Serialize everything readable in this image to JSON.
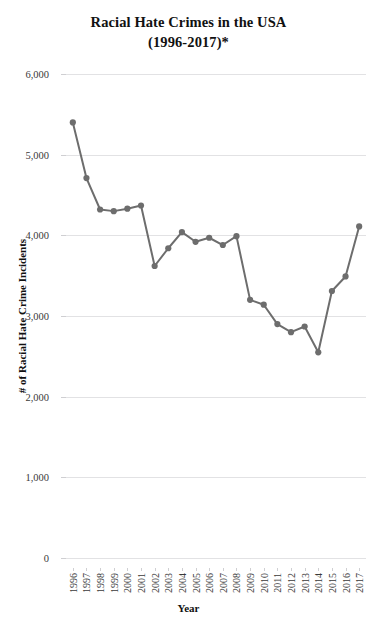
{
  "chart_data": {
    "type": "line",
    "title": "Racial Hate Crimes in the USA (1996-2017)*",
    "title_line1": "Racial Hate Crimes in the USA",
    "title_line2": "(1996-2017)*",
    "xlabel": "Year",
    "ylabel": "# of Racial Hate Crime Incidents",
    "ylim": [
      0,
      6000
    ],
    "ytick_values": [
      0,
      1000,
      2000,
      3000,
      4000,
      5000,
      6000
    ],
    "ytick_labels": [
      "0",
      "1,000",
      "2,000",
      "3,000",
      "4,000",
      "5,000",
      "6,000"
    ],
    "grid": true,
    "legend": false,
    "legend_position": "none",
    "categories": [
      "1996",
      "1997",
      "1998",
      "1999",
      "2000",
      "2001",
      "2002",
      "2003",
      "2004",
      "2005",
      "2006",
      "2007",
      "2008",
      "2009",
      "2010",
      "2011",
      "2012",
      "2013",
      "2014",
      "2015",
      "2016",
      "2017"
    ],
    "values": [
      5400,
      4710,
      4320,
      4300,
      4330,
      4370,
      3620,
      3840,
      4040,
      3920,
      3970,
      3880,
      3990,
      3200,
      3140,
      2900,
      2800,
      2870,
      2550,
      3310,
      3490,
      4110
    ],
    "series": [
      {
        "name": "# of Racial Hate Crime Incidents",
        "color": "#6d6d6d",
        "marker": "circle",
        "values": [
          5400,
          4710,
          4320,
          4300,
          4330,
          4370,
          3620,
          3840,
          4040,
          3920,
          3970,
          3880,
          3990,
          3200,
          3140,
          2900,
          2800,
          2870,
          2550,
          3310,
          3490,
          4110
        ]
      }
    ]
  },
  "colors": {
    "line": "#6d6d6d",
    "marker": "#6d6d6d",
    "gridline": "#e2e2e4",
    "text": "#3a3a3a",
    "title": "#111111",
    "background": "#ffffff"
  }
}
